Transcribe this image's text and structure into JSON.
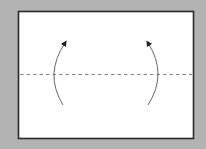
{
  "diagram": {
    "type": "origami-fold-step",
    "background_color": "#b3b3b3",
    "paper": {
      "fill": "#ffffff",
      "stroke": "#2a2a2a",
      "x": 18,
      "y": 11,
      "width": 175,
      "height": 128
    },
    "fold_line": {
      "style": "dashed",
      "kind": "valley-fold",
      "color": "#666666",
      "y": 74
    },
    "arrows": [
      {
        "id": "left-arrow",
        "direction": "up",
        "curve": "bulges-left",
        "color": "#555555"
      },
      {
        "id": "right-arrow",
        "direction": "up",
        "curve": "bulges-right",
        "color": "#555555"
      }
    ]
  }
}
